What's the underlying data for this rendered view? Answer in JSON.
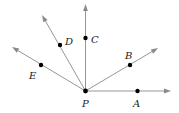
{
  "diagram": {
    "type": "rays from a common endpoint",
    "origin": {
      "label": "P",
      "x": 85.5,
      "y": 91,
      "label_x": 82,
      "label_y": 107
    },
    "rays": [
      {
        "name": "A",
        "label": "A",
        "tip": [
          171,
          91
        ],
        "point": [
          137.5,
          91
        ],
        "label_pos": [
          133,
          107
        ]
      },
      {
        "name": "B",
        "label": "B",
        "tip": [
          158,
          48
        ],
        "point": [
          130,
          65
        ],
        "label_pos": [
          125,
          59
        ]
      },
      {
        "name": "C",
        "label": "C",
        "tip": [
          85.5,
          4
        ],
        "point": [
          85.5,
          38
        ],
        "label_pos": [
          91,
          43
        ]
      },
      {
        "name": "D",
        "label": "D",
        "tip": [
          42,
          15
        ],
        "point": [
          60,
          45
        ],
        "label_pos": [
          65,
          45
        ]
      },
      {
        "name": "E",
        "label": "E",
        "tip": [
          12,
          47
        ],
        "point": [
          41,
          65
        ],
        "label_pos": [
          29,
          79
        ]
      }
    ],
    "colors": {
      "ray": "#8a8a8a",
      "point": "#000000",
      "label": "#222222"
    }
  }
}
